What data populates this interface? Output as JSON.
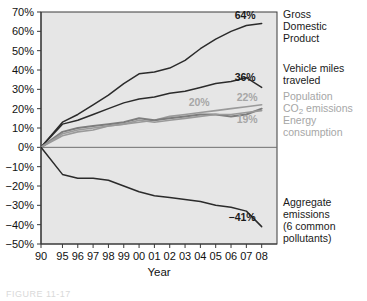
{
  "figure": {
    "caption": "FIGURE 11-17"
  },
  "chart_data": {
    "type": "line",
    "title": "",
    "xlabel": "Year",
    "ylabel": "",
    "x": [
      1990,
      1995,
      1996,
      1997,
      1998,
      1999,
      2000,
      2001,
      2002,
      2003,
      2004,
      2005,
      2006,
      2007,
      2008
    ],
    "tick_labels": [
      "90",
      "95",
      "96",
      "97",
      "98",
      "99",
      "00",
      "01",
      "02",
      "03",
      "04",
      "05",
      "06",
      "07",
      "08"
    ],
    "ylim": [
      -50,
      70
    ],
    "ytick_values": [
      70,
      60,
      50,
      40,
      30,
      20,
      10,
      0,
      -10,
      -20,
      -30,
      -40,
      -50
    ],
    "ytick_labels": [
      "70%",
      "60%",
      "50%",
      "40%",
      "30%",
      "20%",
      "10%",
      "0%",
      "−10%",
      "−20%",
      "−30%",
      "−40%",
      "−50%"
    ],
    "grid": false,
    "legend_position": "right-of-axes",
    "series": [
      {
        "name": "Gross Domestic Product",
        "label": "Gross Domestic Product",
        "label_lines": [
          "Gross",
          "Domestic",
          "Product"
        ],
        "end_value_label": "64%",
        "color": "#2b2b2b",
        "width": 1.5,
        "values": [
          0,
          13,
          17,
          22,
          27,
          33,
          38,
          39,
          41,
          45,
          51,
          56,
          60,
          63,
          64
        ]
      },
      {
        "name": "Vehicle miles traveled",
        "label": "Vehicle miles traveled",
        "label_lines": [
          "Vehicle miles",
          "traveled"
        ],
        "end_value_label": "36%",
        "color": "#2b2b2b",
        "width": 1.5,
        "values": [
          0,
          12,
          14,
          17,
          20,
          23,
          25,
          26,
          28,
          29,
          31,
          33,
          34,
          36,
          31
        ]
      },
      {
        "name": "Population",
        "label": "Population",
        "label_lines": [
          "Population"
        ],
        "end_value_label": "22%",
        "color": "#9a9a9a",
        "width": 1.6,
        "values": [
          0,
          6,
          8,
          9,
          11,
          12,
          13,
          14,
          16,
          17,
          18,
          19,
          20,
          21,
          22
        ]
      },
      {
        "name": "CO2 emissions",
        "label": "CO₂ emissions",
        "label_lines": [
          "CO₂ emissions"
        ],
        "end_value_label": "20%",
        "color": "#7d7d7d",
        "width": 2,
        "values": [
          0,
          8,
          10,
          11,
          12,
          13,
          15,
          14,
          15,
          16,
          17,
          17,
          16,
          17,
          20
        ]
      },
      {
        "name": "Energy consumption",
        "label": "Energy consumption",
        "label_lines": [
          "Energy",
          "consumption"
        ],
        "end_value_label": "19%",
        "color": "#9a9a9a",
        "width": 1.6,
        "values": [
          0,
          7,
          9,
          10,
          11,
          12,
          14,
          13,
          14,
          15,
          16,
          17,
          17,
          18,
          19
        ]
      },
      {
        "name": "Aggregate emissions (6 common pollutants)",
        "label": "Aggregate emissions (6 common pollutants)",
        "label_lines": [
          "Aggregate",
          "emissions",
          "(6 common",
          "pollutants)"
        ],
        "end_value_label": "−41%",
        "color": "#2b2b2b",
        "width": 1.5,
        "values": [
          0,
          -14,
          -16,
          -16,
          -17,
          -20,
          -23,
          -25,
          -26,
          -27,
          -28,
          -30,
          -31,
          -33,
          -41
        ]
      }
    ],
    "annotations": [
      {
        "text": "64%",
        "series": "Gross Domestic Product"
      },
      {
        "text": "36%",
        "series": "Vehicle miles traveled"
      },
      {
        "text": "20%",
        "series": "CO2 emissions"
      },
      {
        "text": "22%",
        "series": "Population"
      },
      {
        "text": "19%",
        "series": "Energy consumption"
      },
      {
        "text": "−41%",
        "series": "Aggregate emissions (6 common pollutants)"
      }
    ]
  },
  "colors": {
    "plot_background": "#e6e6e6",
    "axis": "#3a3a3a",
    "dark_series": "#2b2b2b",
    "gray_series": "#9a9a9a",
    "gray_series_alt": "#7d7d7d",
    "label_gray": "#a6a6a6",
    "label_dark": "#1a1a1a"
  }
}
